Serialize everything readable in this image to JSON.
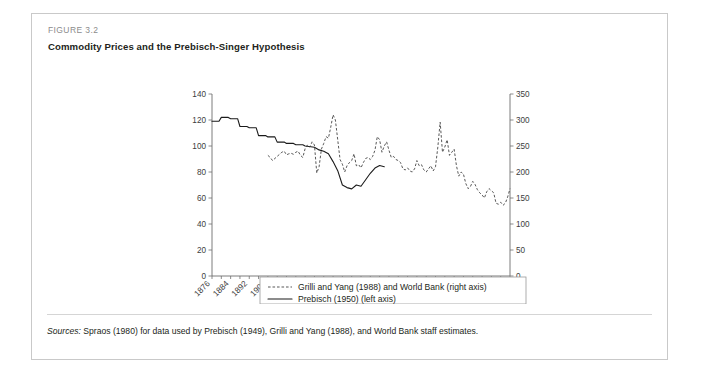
{
  "figure": {
    "label": "FIGURE 3.2",
    "title": "Commodity Prices and the Prebisch-Singer Hypothesis",
    "source_lead": "Sources:",
    "source_rest": " Spraos (1980) for data used by Prebisch (1949), Grilli and Yang (1988), and World Bank staff estimates."
  },
  "colors": {
    "frame": "#c9c9c9",
    "axis": "#6e6e6e",
    "solid_series": "#1b1b1b",
    "dashed_series": "#3a3a3a",
    "label_gray": "#8c8c8c",
    "text": "#231f20"
  },
  "chart_data": {
    "type": "line",
    "title": "Commodity Prices and the Prebisch-Singer Hypothesis",
    "xlabel": "",
    "ylabel": "",
    "grid": false,
    "legend_position": "bottom",
    "xlim": [
      1876,
      2004
    ],
    "x_ticks": [
      1876,
      1884,
      1892,
      1900,
      1908,
      1916,
      1924,
      1932,
      1940,
      1948,
      1956,
      1964,
      1972,
      1980,
      1988,
      1996,
      2004
    ],
    "left_axis": {
      "label": "Prebisch (1950) (left axis)",
      "ylim": [
        0,
        140
      ],
      "ticks": [
        0,
        20,
        40,
        60,
        80,
        100,
        120,
        140
      ]
    },
    "right_axis": {
      "label": "Grilli and Yang (1988) and World Bank (right axis)",
      "ylim": [
        0,
        350
      ],
      "ticks": [
        0,
        50,
        100,
        150,
        200,
        250,
        300,
        350
      ]
    },
    "series": [
      {
        "name": "Prebisch (1950) (left axis)",
        "style": "solid",
        "axis": "left",
        "x": [
          1876,
          1879,
          1880,
          1883,
          1884,
          1887,
          1888,
          1891,
          1892,
          1895,
          1896,
          1899,
          1900,
          1903,
          1904,
          1907,
          1908,
          1911,
          1912,
          1915,
          1916,
          1920,
          1922,
          1924,
          1926,
          1928,
          1930,
          1932,
          1934,
          1936,
          1938,
          1940,
          1942,
          1944,
          1946,
          1948,
          1950
        ],
        "values": [
          119,
          119,
          122,
          122,
          121,
          121,
          115,
          115,
          114,
          114,
          108,
          108,
          107,
          107,
          103,
          103,
          102,
          102,
          101,
          101,
          100,
          99,
          97,
          96,
          94,
          88,
          81,
          70,
          68,
          67,
          70,
          69,
          74,
          79,
          83,
          85,
          84
        ]
      },
      {
        "name": "Grilli and Yang (1988) and World Bank (right axis)",
        "style": "dashed",
        "axis": "right",
        "x": [
          1900,
          1901,
          1902,
          1903,
          1904,
          1905,
          1906,
          1907,
          1908,
          1909,
          1910,
          1911,
          1912,
          1913,
          1914,
          1915,
          1916,
          1917,
          1918,
          1919,
          1920,
          1921,
          1922,
          1923,
          1924,
          1925,
          1926,
          1927,
          1928,
          1929,
          1930,
          1931,
          1932,
          1933,
          1934,
          1935,
          1936,
          1937,
          1938,
          1939,
          1940,
          1941,
          1942,
          1943,
          1944,
          1945,
          1946,
          1947,
          1948,
          1949,
          1950,
          1951,
          1952,
          1953,
          1954,
          1955,
          1956,
          1957,
          1958,
          1959,
          1960,
          1961,
          1962,
          1963,
          1964,
          1965,
          1966,
          1967,
          1968,
          1969,
          1970,
          1971,
          1972,
          1973,
          1974,
          1975,
          1976,
          1977,
          1978,
          1979,
          1980,
          1981,
          1982,
          1983,
          1984,
          1985,
          1986,
          1987,
          1988,
          1989,
          1990,
          1991,
          1992,
          1993,
          1994,
          1995,
          1996,
          1997,
          1998,
          1999,
          2000,
          2001,
          2002,
          2003,
          2004
        ],
        "values": [
          232,
          228,
          222,
          226,
          230,
          234,
          238,
          240,
          233,
          235,
          236,
          234,
          238,
          240,
          232,
          228,
          245,
          252,
          248,
          258,
          252,
          198,
          210,
          244,
          255,
          268,
          265,
          286,
          310,
          300,
          262,
          224,
          215,
          200,
          212,
          218,
          222,
          235,
          212,
          214,
          208,
          218,
          226,
          228,
          224,
          230,
          242,
          268,
          262,
          238,
          250,
          258,
          242,
          228,
          230,
          224,
          222,
          218,
          206,
          204,
          208,
          202,
          200,
          206,
          222,
          212,
          214,
          204,
          200,
          206,
          212,
          202,
          210,
          248,
          296,
          238,
          248,
          262,
          232,
          238,
          244,
          212,
          192,
          200,
          196,
          178,
          168,
          172,
          182,
          176,
          166,
          160,
          156,
          150,
          162,
          168,
          164,
          160,
          140,
          138,
          142,
          136,
          140,
          152,
          168
        ]
      }
    ]
  },
  "legend": {
    "items": [
      {
        "label": "Grilli and Yang (1988) and World Bank (right axis)",
        "style": "dashed"
      },
      {
        "label": "Prebisch (1950) (left axis)",
        "style": "solid"
      }
    ]
  }
}
